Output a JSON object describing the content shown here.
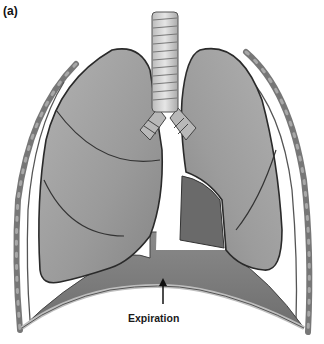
{
  "figure": {
    "panel_label": "(a)",
    "caption": "Expiration",
    "arrow_direction": "up",
    "colors": {
      "background": "#ffffff",
      "lung_fill": "#9a9a9a",
      "lung_outline": "#2a2a2a",
      "diaphragm_fill": "#7a7a7a",
      "rib_fill": "#8c8c8c",
      "trachea_fill": "#d4d4d4"
    }
  }
}
